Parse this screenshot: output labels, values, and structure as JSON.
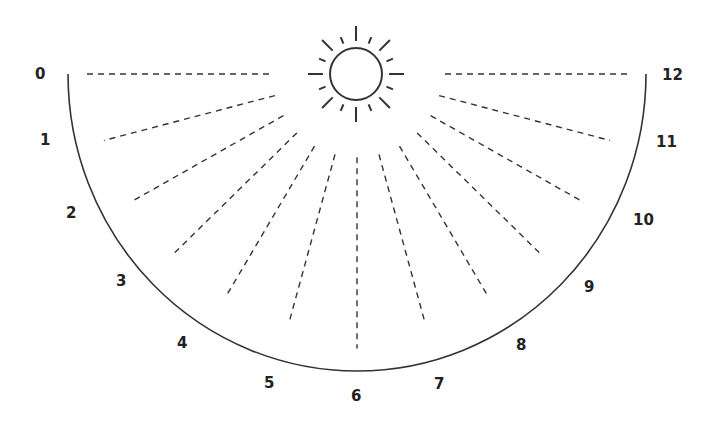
{
  "diagram": {
    "type": "sundial-half-circle",
    "center": [
      357,
      74
    ],
    "radius": 297,
    "hours": [
      {
        "label": "0",
        "angle": 0,
        "lx": 35,
        "ly": 79
      },
      {
        "label": "1",
        "angle": 15,
        "lx": 40,
        "ly": 145
      },
      {
        "label": "2",
        "angle": 30,
        "lx": 66,
        "ly": 218
      },
      {
        "label": "3",
        "angle": 45,
        "lx": 116,
        "ly": 286
      },
      {
        "label": "4",
        "angle": 60,
        "lx": 177,
        "ly": 348
      },
      {
        "label": "5",
        "angle": 75,
        "lx": 264,
        "ly": 388
      },
      {
        "label": "6",
        "angle": 90,
        "lx": 351,
        "ly": 401
      },
      {
        "label": "7",
        "angle": 105,
        "lx": 434,
        "ly": 389
      },
      {
        "label": "8",
        "angle": 120,
        "lx": 516,
        "ly": 350
      },
      {
        "label": "9",
        "angle": 135,
        "lx": 584,
        "ly": 292
      },
      {
        "label": "10",
        "angle": 150,
        "lx": 633,
        "ly": 225
      },
      {
        "label": "11",
        "angle": 165,
        "lx": 656,
        "ly": 147
      },
      {
        "label": "12",
        "angle": 180,
        "lx": 662,
        "ly": 80
      }
    ],
    "sun": {
      "cx": 356,
      "cy": 74,
      "r": 26
    },
    "line_color": "#333333"
  }
}
